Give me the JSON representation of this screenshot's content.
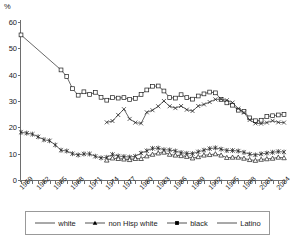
{
  "axis_unit_label": "%",
  "legend": {
    "items": [
      {
        "label": "white",
        "marker": "asterisk-marker-icon"
      },
      {
        "label": "non Hisp white",
        "marker": "triangle-marker-icon"
      },
      {
        "label": "black",
        "marker": "square-marker-icon"
      },
      {
        "label": "Latino",
        "marker": "cross-marker-icon"
      }
    ]
  },
  "chart_data": {
    "type": "line",
    "title": "",
    "xlabel": "",
    "ylabel": "%",
    "ylim": [
      0,
      60
    ],
    "yticks": [
      0,
      10,
      20,
      30,
      40,
      50,
      60
    ],
    "xlim": [
      1959,
      2005
    ],
    "xticks": [
      1959,
      1962,
      1965,
      1968,
      1971,
      1974,
      1977,
      1980,
      1983,
      1986,
      1989,
      1992,
      1995,
      1998,
      2001,
      2004
    ],
    "xtick_step_years": 3,
    "grid": "horizontal",
    "legend_position": "bottom",
    "x": [
      1959,
      1960,
      1961,
      1962,
      1963,
      1964,
      1965,
      1966,
      1967,
      1968,
      1969,
      1970,
      1971,
      1972,
      1973,
      1974,
      1975,
      1976,
      1977,
      1978,
      1979,
      1980,
      1981,
      1982,
      1983,
      1984,
      1985,
      1986,
      1987,
      1988,
      1989,
      1990,
      1991,
      1992,
      1993,
      1994,
      1995,
      1996,
      1997,
      1998,
      1999,
      2000,
      2001,
      2002,
      2003,
      2004,
      2005
    ],
    "series": [
      {
        "name": "white",
        "marker": "asterisk",
        "x": [
          1959,
          1960,
          1961,
          1962,
          1963,
          1964,
          1965,
          1966,
          1967,
          1968,
          1969,
          1970,
          1971,
          1972,
          1973,
          1974,
          1975,
          1976,
          1977,
          1978,
          1979,
          1980,
          1981,
          1982,
          1983,
          1984,
          1985,
          1986,
          1987,
          1988,
          1989,
          1990,
          1991,
          1992,
          1993,
          1994,
          1995,
          1996,
          1997,
          1998,
          1999,
          2000,
          2001,
          2002,
          2003,
          2004,
          2005
        ],
        "values": [
          18.1,
          17.8,
          17.4,
          16.4,
          15.3,
          14.9,
          13.3,
          11.3,
          11.0,
          10.0,
          9.5,
          9.9,
          9.9,
          9.0,
          8.4,
          8.6,
          9.7,
          9.1,
          8.9,
          8.7,
          9.0,
          10.2,
          11.1,
          12.0,
          12.1,
          11.5,
          11.4,
          11.0,
          10.4,
          10.1,
          10.0,
          10.7,
          11.3,
          11.9,
          12.2,
          11.7,
          11.2,
          11.2,
          11.0,
          10.5,
          9.8,
          9.5,
          9.9,
          10.2,
          10.5,
          10.8,
          10.6
        ]
      },
      {
        "name": "non Hisp white",
        "marker": "triangle",
        "x": [
          1974,
          1975,
          1976,
          1977,
          1978,
          1979,
          1980,
          1981,
          1982,
          1983,
          1984,
          1985,
          1986,
          1987,
          1988,
          1989,
          1990,
          1991,
          1992,
          1993,
          1994,
          1995,
          1996,
          1997,
          1998,
          1999,
          2000,
          2001,
          2002,
          2003,
          2004,
          2005
        ],
        "values": [
          7.5,
          8.3,
          8.1,
          7.9,
          7.7,
          8.1,
          8.1,
          9.1,
          9.7,
          10.2,
          10.5,
          9.7,
          9.4,
          9.2,
          8.9,
          8.3,
          8.8,
          9.4,
          9.6,
          9.9,
          9.4,
          8.5,
          8.6,
          8.6,
          8.2,
          7.7,
          7.4,
          7.8,
          8.0,
          8.2,
          8.6,
          8.4
        ]
      },
      {
        "name": "black",
        "marker": "square",
        "x": [
          1959,
          1966,
          1967,
          1968,
          1969,
          1970,
          1971,
          1972,
          1973,
          1974,
          1975,
          1976,
          1977,
          1978,
          1979,
          1980,
          1981,
          1982,
          1983,
          1984,
          1985,
          1986,
          1987,
          1988,
          1989,
          1990,
          1991,
          1992,
          1993,
          1994,
          1995,
          1996,
          1997,
          1998,
          1999,
          2000,
          2001,
          2002,
          2003,
          2004,
          2005
        ],
        "values": [
          55.1,
          41.8,
          39.3,
          34.7,
          32.2,
          33.5,
          32.5,
          33.3,
          31.4,
          30.3,
          31.3,
          31.1,
          31.3,
          30.6,
          31.0,
          32.5,
          34.2,
          35.6,
          35.7,
          33.8,
          31.3,
          31.1,
          32.4,
          31.3,
          30.7,
          31.9,
          32.7,
          33.4,
          33.1,
          30.6,
          29.3,
          28.4,
          26.5,
          26.1,
          23.6,
          22.5,
          22.7,
          24.1,
          24.4,
          24.7,
          24.9
        ]
      },
      {
        "name": "Latino",
        "marker": "cross",
        "x": [
          1974,
          1975,
          1976,
          1977,
          1978,
          1979,
          1980,
          1981,
          1982,
          1983,
          1984,
          1985,
          1986,
          1987,
          1988,
          1989,
          1990,
          1991,
          1992,
          1993,
          1994,
          1995,
          1996,
          1997,
          1998,
          1999,
          2000,
          2001,
          2002,
          2003,
          2004,
          2005
        ],
        "values": [
          21.9,
          22.4,
          24.7,
          26.9,
          23.2,
          21.8,
          21.5,
          25.7,
          26.5,
          28.0,
          30.0,
          28.0,
          27.3,
          28.1,
          26.7,
          26.2,
          28.1,
          28.7,
          29.6,
          30.6,
          30.7,
          30.3,
          29.4,
          27.1,
          25.6,
          22.8,
          21.5,
          21.4,
          21.8,
          22.5,
          21.9,
          21.8
        ]
      }
    ]
  }
}
